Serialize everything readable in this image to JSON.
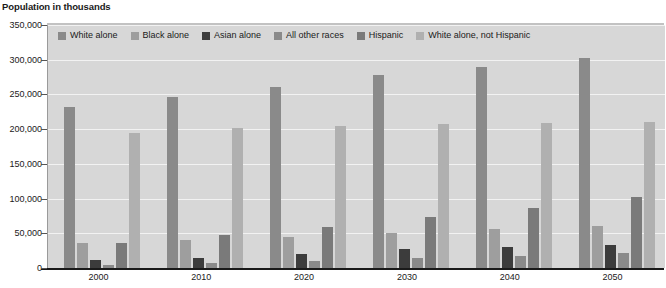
{
  "chart_data": {
    "type": "bar",
    "title": "Population in thousands",
    "xlabel": "",
    "ylabel": "Population in thousands",
    "ylim": [
      0,
      350000
    ],
    "ytick_step": 50000,
    "ytick_labels": [
      "350,000",
      "300,000",
      "250,000",
      "200,000",
      "150,000",
      "100,000",
      "50,000",
      "0"
    ],
    "ytick_values": [
      350000,
      300000,
      250000,
      200000,
      150000,
      100000,
      50000,
      0
    ],
    "grid": true,
    "legend_position": "top-inside",
    "categories": [
      "2000",
      "2010",
      "2020",
      "2030",
      "2040",
      "2050"
    ],
    "series": [
      {
        "name": "White alone",
        "color": "#8a8a8a",
        "values": [
          232000,
          246000,
          261000,
          278000,
          290000,
          302000
        ]
      },
      {
        "name": "Black alone",
        "color": "#9e9e9e",
        "values": [
          36000,
          40000,
          45000,
          50000,
          56000,
          61000
        ]
      },
      {
        "name": "Asian alone",
        "color": "#3c3c3c",
        "values": [
          11000,
          14000,
          20000,
          27000,
          30000,
          33000
        ]
      },
      {
        "name": "All other races",
        "color": "#8a8a8a",
        "values": [
          5000,
          7000,
          10000,
          14000,
          18000,
          22000
        ]
      },
      {
        "name": "Hispanic",
        "color": "#7a7a7a",
        "values": [
          36000,
          47000,
          59000,
          73000,
          87000,
          102000
        ]
      },
      {
        "name": "White alone, not Hispanic",
        "color": "#b0b0b0",
        "values": [
          195000,
          201000,
          205000,
          208000,
          209000,
          210000
        ]
      }
    ]
  },
  "colors": {
    "plot_background": "#d7d7d7",
    "gridline": "#f2f2f2",
    "axis": "#1a1a1a",
    "text": "#1a1a1a"
  }
}
